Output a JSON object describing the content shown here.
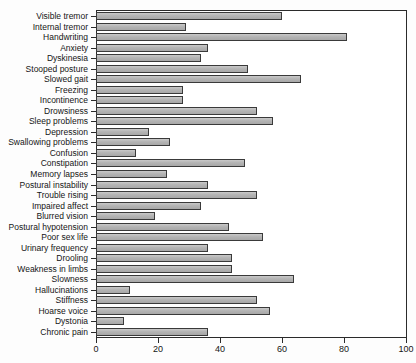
{
  "chart_data": {
    "type": "bar",
    "orientation": "horizontal",
    "title": "",
    "subtitle": "",
    "xlabel": "",
    "ylabel": "",
    "xlim": [
      0,
      100
    ],
    "ylim": null,
    "grid": false,
    "legend": null,
    "legend_position": "none",
    "xticks": [
      0,
      20,
      40,
      60,
      80,
      100
    ],
    "xticklabels": [
      "0",
      "20",
      "40",
      "60",
      "80",
      "100"
    ],
    "bar_fill_color": "#b4b4b4",
    "bar_edge_color": "#3a3a3a",
    "axis_color": "#2b2b2b",
    "background_color": "#ffffff",
    "categories": [
      "Visible tremor",
      "Internal tremor",
      "Handwriting",
      "Anxiety",
      "Dyskinesia",
      "Stooped posture",
      "Slowed gait",
      "Freezing",
      "Incontinence",
      "Drowsiness",
      "Sleep problems",
      "Depression",
      "Swallowing problems",
      "Confusion",
      "Constipation",
      "Memory lapses",
      "Postural instability",
      "Trouble rising",
      "Impaired affect",
      "Blurred vision",
      "Postural hypotension",
      "Poor sex life",
      "Urinary frequency",
      "Drooling",
      "Weakness in limbs",
      "Slowness",
      "Hallucinations",
      "Stiffness",
      "Hoarse voice",
      "Dystonia",
      "Chronic pain"
    ],
    "values": [
      60,
      29,
      81,
      36,
      34,
      49,
      66,
      28,
      28,
      52,
      57,
      17,
      24,
      13,
      48,
      23,
      36,
      52,
      34,
      19,
      43,
      54,
      36,
      44,
      44,
      64,
      11,
      52,
      56,
      9,
      36
    ],
    "series": [
      {
        "name": "",
        "values": [
          60,
          29,
          81,
          36,
          34,
          49,
          66,
          28,
          28,
          52,
          57,
          17,
          24,
          13,
          48,
          23,
          36,
          52,
          34,
          19,
          43,
          54,
          36,
          44,
          44,
          64,
          11,
          52,
          56,
          9,
          36
        ]
      }
    ]
  }
}
